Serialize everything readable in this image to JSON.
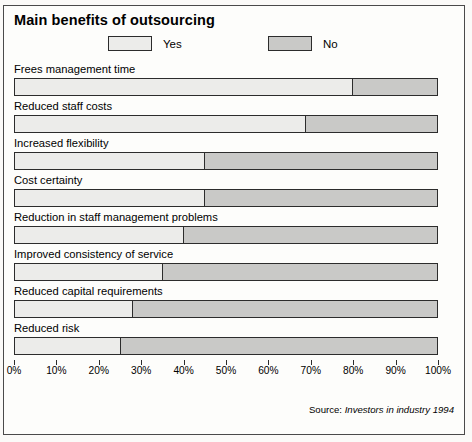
{
  "chart_data": {
    "type": "bar",
    "orientation": "horizontal",
    "stacked": true,
    "percent": true,
    "title": "Main benefits of outsourcing",
    "xlabel": "",
    "ylabel": "",
    "xlim": [
      0,
      100
    ],
    "grid": false,
    "legend_position": "top",
    "categories": [
      "Frees management time",
      "Reduced staff costs",
      "Increased flexibility",
      "Cost certainty",
      "Reduction in staff management problems",
      "Improved consistency of service",
      "Reduced capital requirements",
      "Reduced risk"
    ],
    "series": [
      {
        "name": "Yes",
        "color": "#ececea",
        "values": [
          80,
          69,
          45,
          45,
          40,
          35,
          28,
          25
        ]
      },
      {
        "name": "No",
        "color": "#c9c9c7",
        "values": [
          20,
          31,
          55,
          55,
          60,
          65,
          72,
          75
        ]
      }
    ],
    "tick_labels": [
      "0%",
      "10%",
      "20%",
      "30%",
      "40%",
      "50%",
      "60%",
      "70%",
      "80%",
      "90%",
      "100%"
    ],
    "tick_values": [
      0,
      10,
      20,
      30,
      40,
      50,
      60,
      70,
      80,
      90,
      100
    ],
    "annotations": [
      "Source: Investors in industry 1994"
    ]
  },
  "legend": {
    "yes_label": "Yes",
    "no_label": "No"
  },
  "source": {
    "prefix": "Source: ",
    "citation": "Investors in industry 1994"
  }
}
